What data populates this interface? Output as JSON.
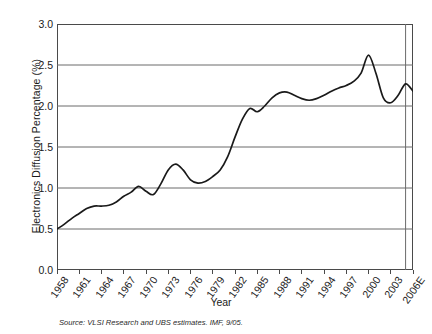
{
  "chart_data": {
    "type": "line",
    "title": "",
    "subtitle": "",
    "xlabel": "Year",
    "ylabel": "Electronics Diffusion Percentage (%)",
    "xlim": [
      1958,
      2006
    ],
    "ylim": [
      0.0,
      3.0
    ],
    "grid": "horizontal",
    "legend": "none",
    "y_ticks": [
      "3.0",
      "2.5",
      "2.0",
      "1.5",
      "1.0",
      "0.5",
      "0.0"
    ],
    "y_tick_values": [
      3.0,
      2.5,
      2.0,
      1.5,
      1.0,
      0.5,
      0.0
    ],
    "x_ticks": [
      "1958",
      "1961",
      "1964",
      "1967",
      "1970",
      "1973",
      "1976",
      "1979",
      "1982",
      "1985",
      "1988",
      "1991",
      "1994",
      "1997",
      "2000",
      "2003",
      "2006E"
    ],
    "x_tick_values": [
      1958,
      1961,
      1964,
      1967,
      1970,
      1973,
      1976,
      1979,
      1982,
      1985,
      1988,
      1991,
      1994,
      1997,
      2000,
      2003,
      2006
    ],
    "forecast_divider_year": 2005,
    "series": [
      {
        "name": "Electronics Diffusion Percentage",
        "color": "#1a1a1a",
        "x": [
          1958,
          1959,
          1960,
          1961,
          1962,
          1963,
          1964,
          1965,
          1966,
          1967,
          1968,
          1969,
          1970,
          1971,
          1972,
          1973,
          1974,
          1975,
          1976,
          1977,
          1978,
          1979,
          1980,
          1981,
          1982,
          1983,
          1984,
          1985,
          1986,
          1987,
          1988,
          1989,
          1990,
          1991,
          1992,
          1993,
          1994,
          1995,
          1996,
          1997,
          1998,
          1999,
          2000,
          2001,
          2002,
          2003,
          2004,
          2005,
          2006
        ],
        "values": [
          0.5,
          0.56,
          0.63,
          0.69,
          0.75,
          0.78,
          0.78,
          0.79,
          0.83,
          0.9,
          0.95,
          1.02,
          0.96,
          0.92,
          1.05,
          1.22,
          1.29,
          1.22,
          1.1,
          1.06,
          1.08,
          1.14,
          1.22,
          1.38,
          1.62,
          1.84,
          1.97,
          1.93,
          2.0,
          2.1,
          2.16,
          2.17,
          2.13,
          2.09,
          2.07,
          2.09,
          2.13,
          2.18,
          2.22,
          2.25,
          2.3,
          2.4,
          2.62,
          2.4,
          2.1,
          2.04,
          2.13,
          2.27,
          2.18
        ]
      }
    ],
    "annotations": {
      "source": "Source: VLSI Research and UBS estimates. IMF, 9/05."
    }
  },
  "axis": {
    "y_title": "Electronics Diffusion Percentage (%)",
    "x_title": "Year"
  },
  "footer": {
    "source": "Source: VLSI Research and UBS estimates. IMF, 9/05."
  }
}
